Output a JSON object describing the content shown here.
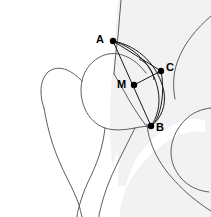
{
  "figure": {
    "background_color": "#ffffff",
    "outline_color": "#5d5d62",
    "shade_color": "#f2f2f2",
    "marker_color": "#000000",
    "width": 211,
    "height": 217
  },
  "points": [
    {
      "id": "A",
      "label": "A",
      "x": 113,
      "y": 41,
      "label_x": 96,
      "label_y": 34
    },
    {
      "id": "C",
      "label": "C",
      "x": 161,
      "y": 71,
      "label_x": 166,
      "label_y": 62
    },
    {
      "id": "M",
      "label": "M",
      "x": 134,
      "y": 85,
      "label_x": 117,
      "label_y": 79
    },
    {
      "id": "B",
      "label": "B",
      "x": 151,
      "y": 126,
      "label_x": 156,
      "label_y": 122
    }
  ],
  "segments": [
    {
      "id": "A-B",
      "from": "A",
      "to": "B",
      "kind": "line"
    },
    {
      "id": "A-C",
      "from": "A",
      "to": "C",
      "kind": "line"
    },
    {
      "id": "M-C",
      "from": "M",
      "to": "C",
      "kind": "line"
    },
    {
      "id": "A-B-arc-outer",
      "from": "A",
      "to": "B",
      "kind": "arc"
    },
    {
      "id": "A-B-arc-inner",
      "from": "A",
      "to": "B",
      "kind": "arc"
    },
    {
      "id": "C-B-arc",
      "from": "C",
      "to": "B",
      "kind": "arc"
    },
    {
      "id": "angle-arc-M",
      "from": "M",
      "to": "M",
      "kind": "angle-marker"
    }
  ],
  "anatomy": [
    {
      "id": "pelvis-shaded-region",
      "name": "pelvis"
    },
    {
      "id": "femur-outline",
      "name": "femur"
    },
    {
      "id": "acetabulum-outline",
      "name": "acetabulum"
    },
    {
      "id": "obturator-foramen-outline",
      "name": "obturator-foramen"
    }
  ]
}
